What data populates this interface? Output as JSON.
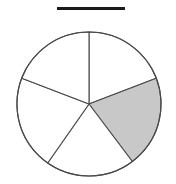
{
  "figure": {
    "kind": "pie-fraction-diagram",
    "title_rule": {
      "name": "answer-blank-rule",
      "visible_text": "",
      "color": "#1a1a1a",
      "x": 57,
      "y": 7,
      "width": 68,
      "height": 3
    },
    "background_color": "#ffffff"
  },
  "chart_data": {
    "type": "pie",
    "title": "",
    "subtitle": "",
    "xlabel": "",
    "ylabel": "",
    "grid": false,
    "legend": "none",
    "center": {
      "x": 89,
      "y": 104
    },
    "radius": 72,
    "total_slices": 5,
    "shaded_slices": 1,
    "fraction_shaded": "1/5",
    "categories": [
      "slice-1",
      "slice-2",
      "slice-3",
      "slice-4",
      "slice-5"
    ],
    "values": [
      69,
      74,
      72,
      76,
      69
    ],
    "labels": [
      "",
      "",
      "",
      "",
      ""
    ],
    "colors": [
      "#ffffff",
      "#c8c8c8",
      "#ffffff",
      "#ffffff",
      "#ffffff"
    ],
    "outline_color": "#4a4a4a",
    "shaded_color": "#c8c8c8",
    "unshaded_color": "#ffffff",
    "slices": [
      {
        "name": "slice-top-right-white",
        "start_deg": 90,
        "end_deg": 21,
        "sweep_deg": 69,
        "shaded": false,
        "fill": "#ffffff"
      },
      {
        "name": "slice-right-shaded",
        "start_deg": 21,
        "end_deg": -53,
        "sweep_deg": 74,
        "shaded": true,
        "fill": "#c8c8c8"
      },
      {
        "name": "slice-bottom-white",
        "start_deg": -53,
        "end_deg": -125,
        "sweep_deg": 72,
        "shaded": false,
        "fill": "#ffffff"
      },
      {
        "name": "slice-bottom-left-white",
        "start_deg": -125,
        "end_deg": -201,
        "sweep_deg": 76,
        "shaded": false,
        "fill": "#ffffff"
      },
      {
        "name": "slice-top-left-white",
        "start_deg": 159,
        "end_deg": 90,
        "sweep_deg": 69,
        "shaded": false,
        "fill": "#ffffff"
      }
    ]
  }
}
